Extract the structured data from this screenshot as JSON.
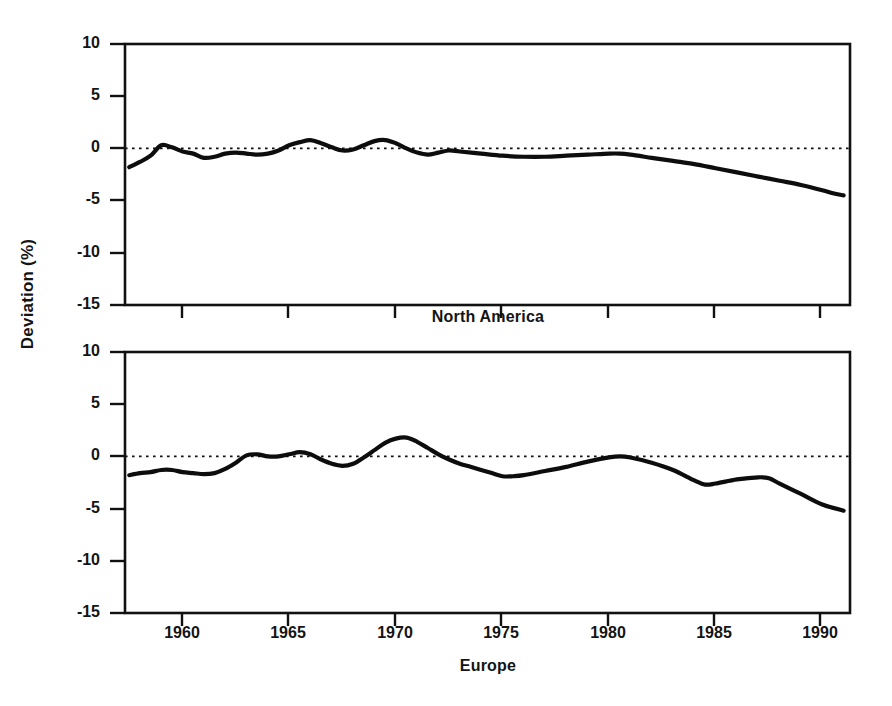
{
  "figure": {
    "background": "#ffffff",
    "ink_color": "#111111",
    "width": 892,
    "height": 706,
    "axis_title_y": "Deviation (%)"
  },
  "chart_data": [
    {
      "type": "line",
      "title": "North America",
      "panel": "top",
      "xlabel": "",
      "ylabel": "Deviation (%)",
      "xlim": [
        1957.3,
        1991.3
      ],
      "ylim": [
        -15,
        10
      ],
      "xticks": [
        1960,
        1965,
        1970,
        1975,
        1980,
        1985,
        1990
      ],
      "xtick_labels": [
        "1960",
        "1965",
        "1970",
        "1975",
        "1980",
        "1985",
        "1990"
      ],
      "yticks": [
        10,
        5,
        0,
        -5,
        -10,
        -15
      ],
      "ytick_labels": [
        "10",
        "5",
        "0",
        "-5",
        "-10",
        "-15"
      ],
      "grid": false,
      "legend": null,
      "reference_line": {
        "y": 0,
        "style": "dotted"
      },
      "line_color": "#0d0d0d",
      "series": [
        {
          "name": "North America",
          "x": [
            1957.5,
            1958.0,
            1958.5,
            1959.0,
            1959.5,
            1960.0,
            1960.5,
            1961.0,
            1961.5,
            1962.0,
            1962.5,
            1963.0,
            1963.5,
            1964.0,
            1964.5,
            1965.0,
            1965.5,
            1966.0,
            1966.5,
            1967.0,
            1967.5,
            1968.0,
            1968.5,
            1969.0,
            1969.5,
            1970.0,
            1970.5,
            1971.0,
            1971.5,
            1972.0,
            1972.5,
            1973.0,
            1974.0,
            1975.0,
            1976.0,
            1977.0,
            1978.0,
            1979.0,
            1980.0,
            1980.5,
            1981.0,
            1982.0,
            1983.0,
            1984.0,
            1985.0,
            1986.0,
            1987.0,
            1988.0,
            1989.0,
            1990.0,
            1990.5,
            1991.0
          ],
          "y": [
            -1.8,
            -1.3,
            -0.7,
            0.3,
            0.1,
            -0.3,
            -0.5,
            -0.9,
            -0.8,
            -0.5,
            -0.4,
            -0.5,
            -0.6,
            -0.5,
            -0.2,
            0.3,
            0.6,
            0.8,
            0.5,
            0.1,
            -0.2,
            -0.1,
            0.3,
            0.7,
            0.8,
            0.5,
            0.0,
            -0.4,
            -0.6,
            -0.4,
            -0.2,
            -0.3,
            -0.5,
            -0.7,
            -0.8,
            -0.8,
            -0.7,
            -0.6,
            -0.5,
            -0.5,
            -0.6,
            -0.9,
            -1.2,
            -1.5,
            -1.9,
            -2.3,
            -2.7,
            -3.1,
            -3.5,
            -4.0,
            -4.3,
            -4.5
          ]
        }
      ]
    },
    {
      "type": "line",
      "title": "Europe",
      "panel": "bottom",
      "xlabel": "",
      "ylabel": "Deviation (%)",
      "xlim": [
        1957.3,
        1991.3
      ],
      "ylim": [
        -15,
        10
      ],
      "xticks": [
        1960,
        1965,
        1970,
        1975,
        1980,
        1985,
        1990
      ],
      "xtick_labels": [
        "1960",
        "1965",
        "1970",
        "1975",
        "1980",
        "1985",
        "1990"
      ],
      "yticks": [
        10,
        5,
        0,
        -5,
        -10,
        -15
      ],
      "ytick_labels": [
        "10",
        "5",
        "0",
        "-5",
        "-10",
        "-15"
      ],
      "grid": false,
      "legend": null,
      "reference_line": {
        "y": 0,
        "style": "dotted"
      },
      "line_color": "#0d0d0d",
      "series": [
        {
          "name": "Europe",
          "x": [
            1957.5,
            1958.0,
            1958.5,
            1959.0,
            1959.5,
            1960.0,
            1960.5,
            1961.0,
            1961.5,
            1962.0,
            1962.5,
            1963.0,
            1963.5,
            1964.0,
            1964.5,
            1965.0,
            1965.5,
            1966.0,
            1966.5,
            1967.0,
            1967.5,
            1968.0,
            1968.5,
            1969.0,
            1969.5,
            1970.0,
            1970.5,
            1971.0,
            1971.5,
            1972.0,
            1972.5,
            1973.0,
            1973.5,
            1974.0,
            1974.5,
            1975.0,
            1975.5,
            1976.0,
            1977.0,
            1978.0,
            1979.0,
            1980.0,
            1980.5,
            1981.0,
            1982.0,
            1983.0,
            1984.0,
            1984.5,
            1985.0,
            1986.0,
            1987.0,
            1987.5,
            1988.0,
            1989.0,
            1990.0,
            1991.0
          ],
          "y": [
            -1.8,
            -1.6,
            -1.5,
            -1.3,
            -1.3,
            -1.5,
            -1.6,
            -1.7,
            -1.6,
            -1.2,
            -0.6,
            0.1,
            0.2,
            0.0,
            0.0,
            0.2,
            0.4,
            0.2,
            -0.3,
            -0.7,
            -0.9,
            -0.7,
            -0.1,
            0.6,
            1.3,
            1.7,
            1.8,
            1.4,
            0.8,
            0.2,
            -0.3,
            -0.7,
            -1.0,
            -1.3,
            -1.6,
            -1.9,
            -1.9,
            -1.8,
            -1.4,
            -1.0,
            -0.5,
            -0.1,
            0.0,
            -0.1,
            -0.6,
            -1.3,
            -2.3,
            -2.7,
            -2.6,
            -2.2,
            -2.0,
            -2.1,
            -2.6,
            -3.6,
            -4.6,
            -5.2
          ]
        }
      ]
    }
  ]
}
